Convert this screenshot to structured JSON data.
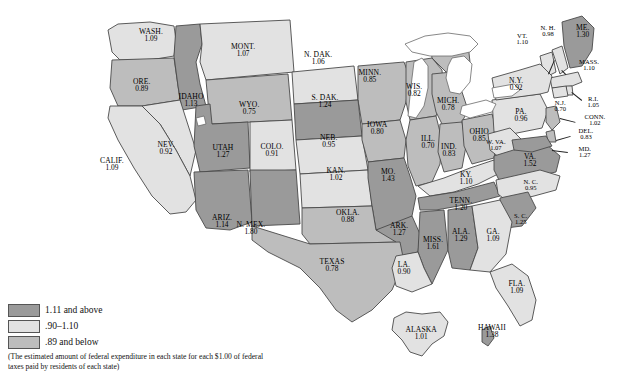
{
  "chart_data": {
    "type": "map",
    "legend": {
      "position": "bottom-left",
      "entries": [
        {
          "label": "1.11 and above",
          "color": "#9a9a9a",
          "key": "high"
        },
        {
          "label": ".90–1.10",
          "color": "#e2e2e2",
          "key": "mid"
        },
        {
          "label": ".89 and below",
          "color": "#bdbdbd",
          "key": "low"
        }
      ],
      "note": "(The estimated amount of federal expenditure in each state for each $1.00 of federal taxes paid by residents of each state)"
    },
    "value_label": "federal expenditure per $1.00 of federal taxes paid",
    "states": [
      {
        "name": "WASH.",
        "value": "1.09",
        "num": 1.09,
        "cls": "mid"
      },
      {
        "name": "ORE.",
        "value": "0.89",
        "num": 0.89,
        "cls": "low"
      },
      {
        "name": "IDAHO",
        "value": "1.13",
        "num": 1.13,
        "cls": "high"
      },
      {
        "name": "MONT.",
        "value": "1.07",
        "num": 1.07,
        "cls": "mid"
      },
      {
        "name": "N. DAK.",
        "value": "1.06",
        "num": 1.06,
        "cls": "mid"
      },
      {
        "name": "MINN.",
        "value": "0.85",
        "num": 0.85,
        "cls": "low"
      },
      {
        "name": "WIS.",
        "value": "0.82",
        "num": 0.82,
        "cls": "low"
      },
      {
        "name": "MICH.",
        "value": "0.78",
        "num": 0.78,
        "cls": "low"
      },
      {
        "name": "S. DAK.",
        "value": "1.24",
        "num": 1.24,
        "cls": "high"
      },
      {
        "name": "WYO.",
        "value": "0.75",
        "num": 0.75,
        "cls": "low"
      },
      {
        "name": "NEV.",
        "value": "0.92",
        "num": 0.92,
        "cls": "mid"
      },
      {
        "name": "CALIF.",
        "value": "1.09",
        "num": 1.09,
        "cls": "mid"
      },
      {
        "name": "UTAH",
        "value": "1.27",
        "num": 1.27,
        "cls": "high"
      },
      {
        "name": "COLO.",
        "value": "0.91",
        "num": 0.91,
        "cls": "mid"
      },
      {
        "name": "NEB.",
        "value": "0.95",
        "num": 0.95,
        "cls": "mid"
      },
      {
        "name": "IOWA",
        "value": "0.80",
        "num": 0.8,
        "cls": "low"
      },
      {
        "name": "ILL.",
        "value": "0.70",
        "num": 0.7,
        "cls": "low"
      },
      {
        "name": "IND.",
        "value": "0.83",
        "num": 0.83,
        "cls": "low"
      },
      {
        "name": "OHIO",
        "value": "0.85",
        "num": 0.85,
        "cls": "low"
      },
      {
        "name": "PA.",
        "value": "0.96",
        "num": 0.96,
        "cls": "mid"
      },
      {
        "name": "KAN.",
        "value": "1.02",
        "num": 1.02,
        "cls": "mid"
      },
      {
        "name": "MO.",
        "value": "1.43",
        "num": 1.43,
        "cls": "high"
      },
      {
        "name": "KY.",
        "value": "1.10",
        "num": 1.1,
        "cls": "mid"
      },
      {
        "name": "W. VA.",
        "value": "1.07",
        "num": 1.07,
        "cls": "mid"
      },
      {
        "name": "VA.",
        "value": "1.52",
        "num": 1.52,
        "cls": "high"
      },
      {
        "name": "ARIZ.",
        "value": "1.14",
        "num": 1.14,
        "cls": "high"
      },
      {
        "name": "N. MEX.",
        "value": "1.80",
        "num": 1.8,
        "cls": "high"
      },
      {
        "name": "OKLA.",
        "value": "0.88",
        "num": 0.88,
        "cls": "low"
      },
      {
        "name": "ARK.",
        "value": "1.27",
        "num": 1.27,
        "cls": "high"
      },
      {
        "name": "TENN.",
        "value": "1.20",
        "num": 1.2,
        "cls": "high"
      },
      {
        "name": "N. C.",
        "value": "0.95",
        "num": 0.95,
        "cls": "mid"
      },
      {
        "name": "S. C.",
        "value": "1.25",
        "num": 1.25,
        "cls": "high"
      },
      {
        "name": "MISS.",
        "value": "1.61",
        "num": 1.61,
        "cls": "high"
      },
      {
        "name": "ALA.",
        "value": "1.29",
        "num": 1.29,
        "cls": "high"
      },
      {
        "name": "GA.",
        "value": "1.09",
        "num": 1.09,
        "cls": "mid"
      },
      {
        "name": "TEXAS",
        "value": "0.78",
        "num": 0.78,
        "cls": "low"
      },
      {
        "name": "LA.",
        "value": "0.90",
        "num": 0.9,
        "cls": "mid"
      },
      {
        "name": "FLA.",
        "value": "1.09",
        "num": 1.09,
        "cls": "mid"
      },
      {
        "name": "ME.",
        "value": "1.30",
        "num": 1.3,
        "cls": "high"
      },
      {
        "name": "N. H.",
        "value": "0.98",
        "num": 0.98,
        "cls": "mid"
      },
      {
        "name": "VT.",
        "value": "1.10",
        "num": 1.1,
        "cls": "mid"
      },
      {
        "name": "MASS.",
        "value": "1.10",
        "num": 1.1,
        "cls": "mid"
      },
      {
        "name": "N.Y.",
        "value": "0.92",
        "num": 0.92,
        "cls": "mid"
      },
      {
        "name": "R.I.",
        "value": "1.05",
        "num": 1.05,
        "cls": "mid"
      },
      {
        "name": "CONN.",
        "value": "1.02",
        "num": 1.02,
        "cls": "mid"
      },
      {
        "name": "N.J.",
        "value": "0.70",
        "num": 0.7,
        "cls": "low"
      },
      {
        "name": "DEL.",
        "value": "0.83",
        "num": 0.83,
        "cls": "low"
      },
      {
        "name": "MD.",
        "value": "1.27",
        "num": 1.27,
        "cls": "high"
      },
      {
        "name": "ALASKA",
        "value": "1.01",
        "num": 1.01,
        "cls": "mid"
      },
      {
        "name": "HAWAII",
        "value": "1.38",
        "num": 1.38,
        "cls": "high"
      }
    ]
  },
  "bottom_caption": "(partially cropped caption line)"
}
